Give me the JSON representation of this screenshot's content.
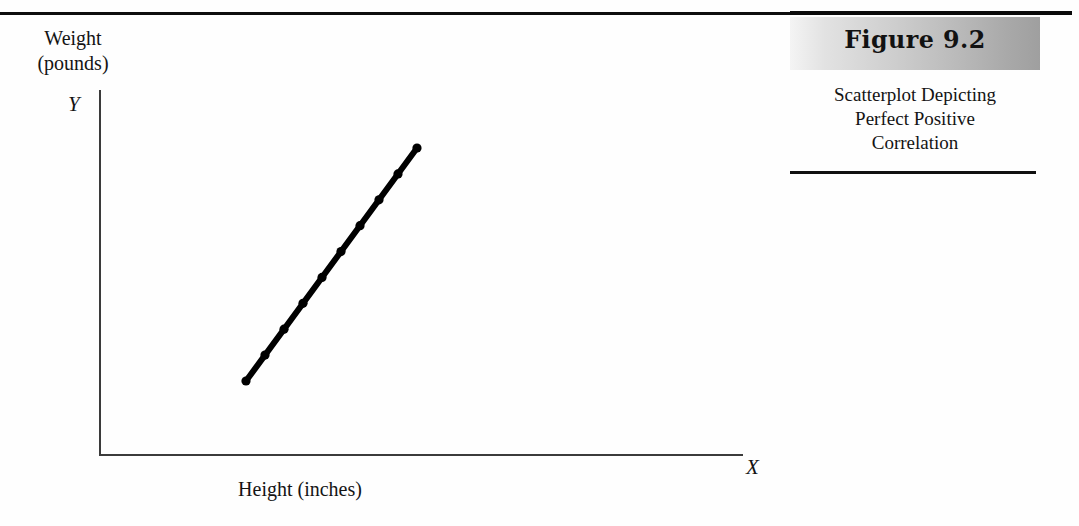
{
  "figure": {
    "number_label": "Figure 9.2",
    "caption_lines": [
      "Scatterplot Depicting",
      "Perfect Positive",
      "Correlation"
    ]
  },
  "axes": {
    "y_label_line1": "Weight",
    "y_label_line2": "(pounds)",
    "y_axis_letter": "Y",
    "x_axis_letter": "X",
    "x_label": "Height (inches)"
  },
  "colors": {
    "ink": "#111111",
    "axis": "#3b3b3b",
    "rule": "#0d0d0d",
    "band_light": "#f4f4f4",
    "band_dark": "#9f9f9f",
    "data_line": "#000000"
  },
  "chart_data": {
    "type": "scatter",
    "title": "Scatterplot Depicting Perfect Positive Correlation",
    "xlabel": "Height (inches)",
    "ylabel": "Weight (pounds)",
    "x_axis_symbol": "X",
    "y_axis_symbol": "Y",
    "grid": false,
    "legend": "none",
    "tick_labels_x": [],
    "tick_labels_y": [],
    "correlation": 1.0,
    "annotation": "All points fall exactly on a straight upward-sloping line (perfect positive correlation, r = +1.00)",
    "xlim": [
      0,
      10
    ],
    "ylim": [
      0,
      10
    ],
    "points": [
      {
        "x": 2.3,
        "y": 1.6
      },
      {
        "x": 2.7,
        "y": 2.1
      },
      {
        "x": 3.1,
        "y": 2.6
      },
      {
        "x": 3.5,
        "y": 3.1
      },
      {
        "x": 3.9,
        "y": 3.6
      },
      {
        "x": 4.3,
        "y": 4.1
      },
      {
        "x": 4.7,
        "y": 4.6
      },
      {
        "x": 5.1,
        "y": 5.1
      },
      {
        "x": 5.5,
        "y": 5.6
      },
      {
        "x": 5.9,
        "y": 6.1
      }
    ],
    "fit_line": {
      "start_px": [
        246,
        381
      ],
      "end_px": [
        417,
        148
      ],
      "style": "solid",
      "width_px": 6
    }
  }
}
